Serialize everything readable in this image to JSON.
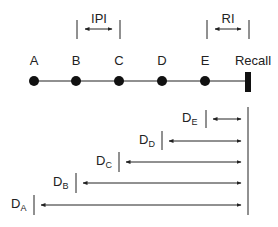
{
  "diagram": {
    "timeline": {
      "points": [
        {
          "label": "A",
          "x": 34
        },
        {
          "label": "B",
          "x": 76
        },
        {
          "label": "C",
          "x": 119
        },
        {
          "label": "D",
          "x": 162
        },
        {
          "label": "E",
          "x": 205
        }
      ],
      "recall_label": "Recall"
    },
    "intervals": {
      "ipi_label": "IPI",
      "ri_label": "RI"
    },
    "delays": [
      {
        "main": "D",
        "sub": "E"
      },
      {
        "main": "D",
        "sub": "D"
      },
      {
        "main": "D",
        "sub": "C"
      },
      {
        "main": "D",
        "sub": "B"
      },
      {
        "main": "D",
        "sub": "A"
      }
    ],
    "colors": {
      "line": "#222222"
    }
  }
}
